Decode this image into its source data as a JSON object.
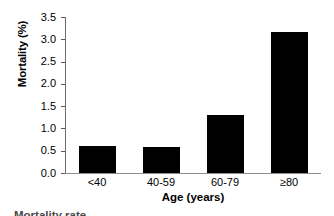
{
  "chart_data": {
    "type": "bar",
    "title": "",
    "categories": [
      "<40",
      "40-59",
      "60-79",
      "≥80"
    ],
    "values": [
      0.6,
      0.59,
      1.3,
      3.16
    ],
    "series": [
      {
        "name": "Mortality",
        "values": [
          0.6,
          0.59,
          1.3,
          3.16
        ]
      }
    ],
    "xlabel": "Age (years)",
    "ylabel": "Mortality (%)",
    "ylim": [
      0.0,
      3.5
    ],
    "yticks": [
      "0.0",
      "0.5",
      "1.0",
      "1.5",
      "2.0",
      "2.5",
      "3.0",
      "3.5"
    ],
    "ytick_values": [
      0.0,
      0.5,
      1.0,
      1.5,
      2.0,
      2.5,
      3.0,
      3.5
    ],
    "grid": false,
    "legend": null,
    "bar_color": "#000000",
    "axis_color": "#6b6b6b"
  },
  "caption": {
    "text": "Mortality rate"
  }
}
